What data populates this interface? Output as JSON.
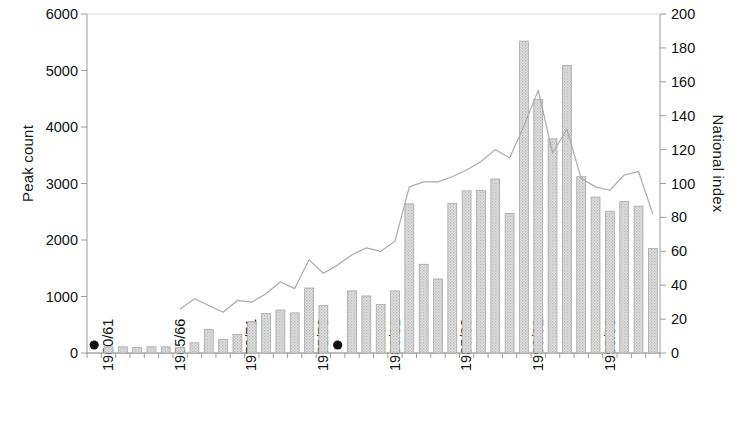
{
  "chart_data": {
    "type": "bar",
    "title": "",
    "xlabel": "",
    "ylabel": "Peak count",
    "y2label": "National index",
    "ylim": [
      0,
      6000
    ],
    "y2lim": [
      0,
      200
    ],
    "yticks": [
      "0",
      "1000",
      "2000",
      "3000",
      "4000",
      "5000",
      "6000"
    ],
    "ytick_values": [
      0,
      1000,
      2000,
      3000,
      4000,
      5000,
      6000
    ],
    "y2ticks": [
      "0",
      "20",
      "40",
      "60",
      "80",
      "100",
      "120",
      "140",
      "160",
      "180",
      "200"
    ],
    "y2tick_values": [
      0,
      20,
      40,
      60,
      80,
      100,
      120,
      140,
      160,
      180,
      200
    ],
    "grid": false,
    "legend": "none",
    "categories": [
      "1960/61",
      "1961/62",
      "1962/63",
      "1963/64",
      "1964/65",
      "1965/66",
      "1966/67",
      "1967/68",
      "1968/69",
      "1969/70",
      "1970/71",
      "1971/72",
      "1972/73",
      "1973/74",
      "1974/75",
      "1975/76",
      "1976/77",
      "1977/78",
      "1978/79",
      "1979/80",
      "1980/81",
      "1981/82",
      "1982/83",
      "1983/84",
      "1984/85",
      "1985/86",
      "1986/87",
      "1987/88",
      "1988/89",
      "1989/90",
      "1990/91",
      "1991/92",
      "1992/93",
      "1993/94",
      "1994/95",
      "1995/96",
      "1996/97",
      "1997/98",
      "1998/99",
      "1999/00"
    ],
    "xtick_labels": [
      "1960/61",
      "1965/66",
      "1970/71",
      "1975/76",
      "1980/81",
      "1985/86",
      "1990/91",
      "1995/96"
    ],
    "xtick_indices": [
      0,
      5,
      10,
      15,
      20,
      25,
      30,
      35
    ],
    "series": [
      {
        "name": "Peak count",
        "type": "bar",
        "axis": "left",
        "color": "#d0d0d0",
        "values": [
          null,
          110,
          110,
          100,
          110,
          110,
          100,
          180,
          420,
          240,
          330,
          550,
          700,
          760,
          710,
          1150,
          840,
          null,
          1100,
          1010,
          860,
          1100,
          2640,
          1570,
          1310,
          2650,
          2870,
          2880,
          3080,
          2470,
          5520,
          4490,
          3790,
          5090,
          3120,
          2760,
          2510,
          2680,
          2600,
          1850
        ]
      },
      {
        "name": "National index",
        "type": "line",
        "axis": "right",
        "color": "#aaaaaa",
        "start_index": 6,
        "values": [
          null,
          null,
          null,
          null,
          null,
          null,
          26,
          32,
          28,
          24,
          31,
          30,
          35,
          42,
          38,
          55,
          47,
          52,
          58,
          62,
          60,
          66,
          98,
          101,
          101,
          104,
          108,
          113,
          120,
          115,
          134,
          155,
          118,
          132,
          103,
          98,
          96,
          105,
          107,
          82
        ]
      }
    ],
    "markers": [
      {
        "name": "missing-data-marker",
        "category": "1960/61",
        "index": 0,
        "value": 0
      },
      {
        "name": "missing-data-marker",
        "category": "1977/78",
        "index": 17,
        "value": 0
      }
    ]
  }
}
